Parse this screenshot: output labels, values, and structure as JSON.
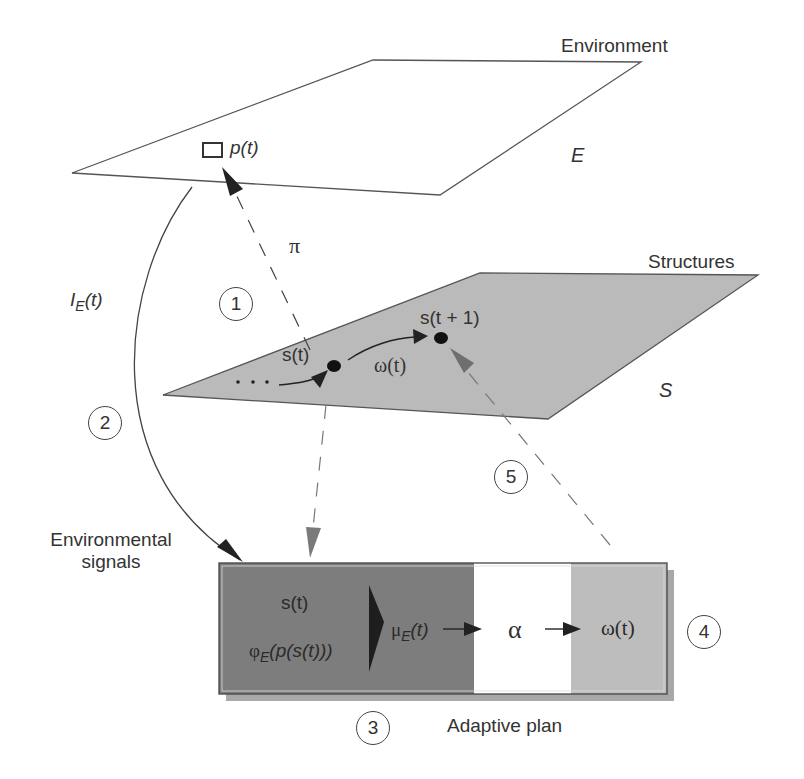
{
  "planes": {
    "environment": {
      "title": "Environment",
      "symbol": "E",
      "point_label": "p",
      "point_arg": "(t)"
    },
    "structures": {
      "title": "Structures",
      "symbol": "S",
      "current_state": "s(t)",
      "next_state": "s(t + 1)",
      "operator": "ω(t)",
      "ellipsis": "· · ·"
    }
  },
  "arrows": {
    "pi_label": "π",
    "signal_label_main": "I",
    "signal_label_sub": "E",
    "signal_label_arg": "(t)"
  },
  "labels": {
    "environmental_signals_line1": "Environmental",
    "environmental_signals_line2": "signals",
    "adaptive_plan": "Adaptive plan"
  },
  "adaptive_plan_box": {
    "input_state": "s(t)",
    "payoff_main": "φ",
    "payoff_sub": "E",
    "payoff_arg": "(p(s(t)))",
    "mu_main": "μ",
    "mu_sub": "E",
    "mu_arg": "(t)",
    "alpha": "α",
    "output": "ω(t)",
    "colors": {
      "dark_section": "#7d7d7d",
      "middle_section": "#ffffff",
      "light_section": "#bdbdbd"
    }
  },
  "steps": [
    "1",
    "2",
    "3",
    "4",
    "5"
  ],
  "colors": {
    "structures_plane": "#b9b9b9",
    "line": "#444444",
    "gray_arrow": "#777777"
  }
}
